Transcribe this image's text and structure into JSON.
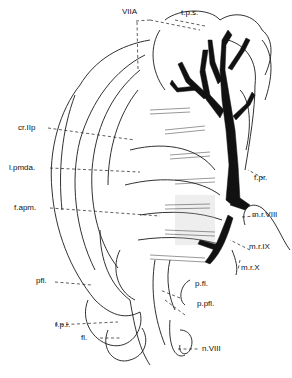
{
  "figure": {
    "labels": {
      "viia": "VIIA",
      "tps": "t.p.s.",
      "crIIp": "cr.IIp",
      "lpmda": "l.pmda.",
      "fapm": "f.apm.",
      "fpr": "f.pr.",
      "mrVIII": "m.r.VIII",
      "mrIX": "m.r.IX",
      "mrX": "m.r.X",
      "pfl_left": "pfl.",
      "pfl_right": "p.fl.",
      "ppfl": "p.pfl.",
      "fpl": "f.p.l.",
      "fl": "fl.",
      "nVIII": "n.VIII"
    },
    "colors": {
      "ink": "#111111",
      "background": "#ffffff"
    }
  }
}
